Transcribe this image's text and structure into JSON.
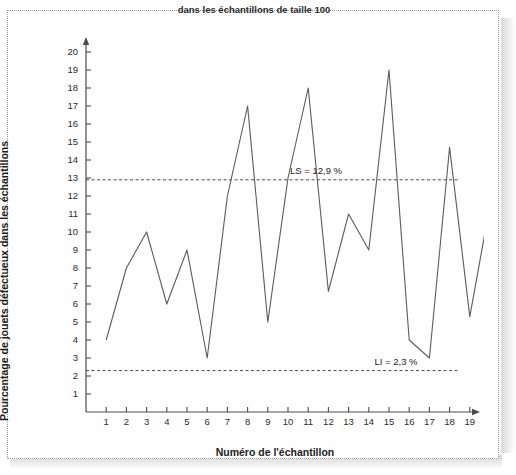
{
  "figure": {
    "title": "dans les échantillons de taille 100",
    "background_color": "#ffffff",
    "frame_style": "dotted",
    "frame_color": "#9a9a9a",
    "line_color": "#5b5b5b",
    "axis_color": "#4a4a4a",
    "limit_line_color": "#4a4a4a"
  },
  "chart_data": {
    "type": "line",
    "title": "dans les échantillons de taille 100",
    "xlabel": "Numéro de l'échantillon",
    "ylabel": "Pourcentage de jouets défectueux dans les échantillons",
    "x": [
      1,
      2,
      3,
      4,
      5,
      6,
      7,
      8,
      9,
      10,
      11,
      12,
      13,
      14,
      15,
      16,
      17,
      18,
      19,
      20
    ],
    "values": [
      4,
      8,
      10,
      6,
      9,
      3,
      12,
      17,
      5,
      13,
      18,
      6.7,
      11,
      9,
      19,
      4,
      3,
      14.7,
      5.3,
      11.5
    ],
    "xlim": [
      0,
      21
    ],
    "ylim": [
      0,
      21
    ],
    "xticks": [
      "1",
      "2",
      "3",
      "4",
      "5",
      "6",
      "7",
      "8",
      "9",
      "10",
      "11",
      "12",
      "13",
      "14",
      "15",
      "16",
      "17",
      "18",
      "19",
      "20"
    ],
    "yticks": [
      "1",
      "2",
      "3",
      "4",
      "5",
      "6",
      "7",
      "8",
      "9",
      "10",
      "11",
      "12",
      "13",
      "14",
      "15",
      "16",
      "17",
      "18",
      "19",
      "20"
    ],
    "grid": false,
    "legend": "none",
    "annotations": [
      {
        "name": "upper-spec-limit",
        "label": "LS = 12,9 %",
        "value": 12.9,
        "style": "dashed-horizontal"
      },
      {
        "name": "lower-spec-limit",
        "label": "LI = 2,3 %",
        "value": 2.3,
        "style": "dashed-horizontal"
      }
    ]
  },
  "axes": {
    "x_axis_label": "Numéro de l'échantillon",
    "y_axis_label": "Pourcentage de jouets défectueux dans les échantillons"
  },
  "limits": {
    "upper_label": "LS = 12,9 %",
    "lower_label": "LI = 2,3 %"
  }
}
